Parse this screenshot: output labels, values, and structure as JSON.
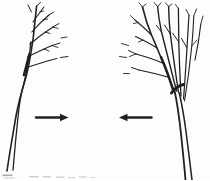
{
  "colors": {
    "paper": "#fdfdfb",
    "ink": "#202020",
    "caption_remnant": "#8d8d8d"
  },
  "figure": {
    "icons": [
      {
        "name": "left-tree-sketch",
        "shape": "bare sketched tree leaning right, branches fanning to upper right"
      },
      {
        "name": "right-tree-sketch",
        "shape": "bare sketched tree leaning left, bushier crown fanning to upper left"
      },
      {
        "name": "arrow-right-icon",
        "glyph": "→"
      },
      {
        "name": "arrow-left-icon",
        "glyph": "←"
      }
    ],
    "caption": ""
  }
}
